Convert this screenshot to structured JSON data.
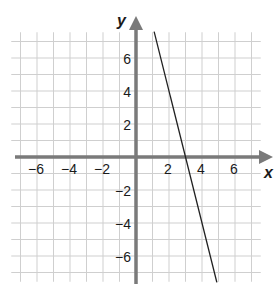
{
  "chart_data": {
    "type": "line",
    "title": "",
    "xlabel": "x",
    "ylabel": "y",
    "xlim": [
      -7.5,
      7.5
    ],
    "ylim": [
      -7.5,
      7.5
    ],
    "grid": true,
    "grid_step": 1,
    "x_ticks": [
      -6,
      -4,
      -2,
      2,
      4,
      6
    ],
    "y_ticks": [
      6,
      4,
      2,
      -2,
      -4,
      -6
    ],
    "x_tick_labels": [
      "−6",
      "−4",
      "−2",
      "2",
      "4",
      "6"
    ],
    "y_tick_labels": [
      "6",
      "4",
      "2",
      "−2",
      "−4",
      "−6"
    ],
    "series": [
      {
        "name": "line",
        "equation": "y = -4x + 12",
        "x": [
          1.1,
          4.9
        ],
        "y": [
          7.6,
          -7.6
        ],
        "color": "#222222"
      }
    ],
    "x_intercept": 3,
    "legend": null
  },
  "colors": {
    "grid": "#cfcfcf",
    "axis": "#7a7a7a",
    "line": "#222222",
    "text": "#1a1a1a"
  }
}
